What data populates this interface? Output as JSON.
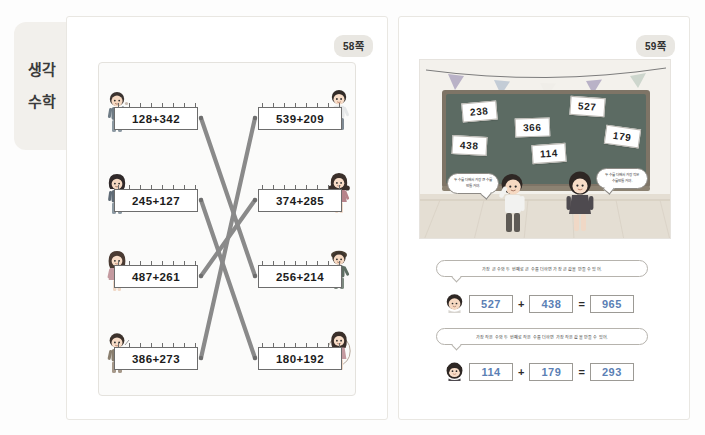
{
  "spread": {
    "side_tab": {
      "line1": "생각",
      "line2": "수학"
    },
    "pages": [
      {
        "badge": "58쪽"
      },
      {
        "badge": "59쪽"
      }
    ]
  },
  "page58": {
    "title": "58쪽",
    "left_column": [
      {
        "expr": "128+342"
      },
      {
        "expr": "245+127"
      },
      {
        "expr": "487+261"
      },
      {
        "expr": "386+273"
      }
    ],
    "right_column": [
      {
        "expr": "539+209"
      },
      {
        "expr": "374+285"
      },
      {
        "expr": "256+214"
      },
      {
        "expr": "180+192"
      }
    ],
    "matching_lines": [
      {
        "from": "128+342",
        "to": "256+214"
      },
      {
        "from": "245+127",
        "to": "180+192"
      },
      {
        "from": "487+261",
        "to": "374+285"
      },
      {
        "from": "386+273",
        "to": "539+209"
      }
    ]
  },
  "page59": {
    "title": "59쪽",
    "board_cards": [
      {
        "value": "238"
      },
      {
        "value": "527"
      },
      {
        "value": "366"
      },
      {
        "value": "179"
      },
      {
        "value": "438"
      },
      {
        "value": "114"
      }
    ],
    "bubbles": [
      {
        "speaker": "boy",
        "text": "두 수를 더해서 가장 큰 수를 만들 거야."
      },
      {
        "speaker": "girl",
        "text": "두 수를 더해서 가장 작은 수를 만들 거야."
      }
    ],
    "tasks": [
      {
        "instruction": "가장 큰 수와 두 번째로 큰 수를 더하면 가장 큰 값을 만들 수 있어.",
        "answer": {
          "a": "527",
          "op": "+",
          "b": "438",
          "eq": "=",
          "sum": "965"
        }
      },
      {
        "instruction": "가장 작은 수와 두 번째로 작은 수를 더하면 가장 작은 값을 만들 수 있어.",
        "answer": {
          "a": "114",
          "op": "+",
          "b": "179",
          "eq": "=",
          "sum": "293"
        }
      }
    ],
    "bunting_pennants": 5
  },
  "colors": {
    "answer_ink": "#5b7fb5",
    "line_gray": "#8a8a8a",
    "board_green": "#5c6b63",
    "tab_bg": "#f2f0ec"
  }
}
